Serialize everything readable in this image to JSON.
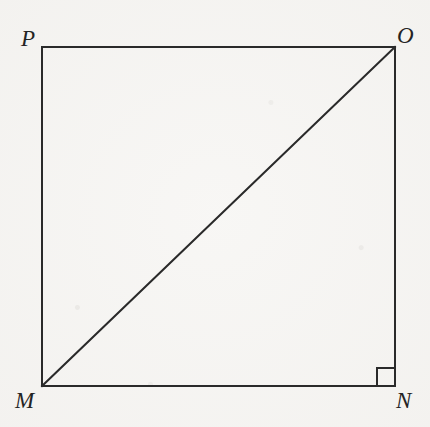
{
  "figure": {
    "name": "square-with-diagonal",
    "background_color": "#f5f4f2",
    "stroke_color": "#2a2a2a",
    "stroke_width": 2,
    "canvas": {
      "width": 430,
      "height": 427
    },
    "square": {
      "left": 42,
      "top": 47,
      "right": 395,
      "bottom": 386
    },
    "vertices": [
      {
        "id": "P",
        "label": "P",
        "x": 42,
        "y": 47,
        "position": "top-left"
      },
      {
        "id": "O",
        "label": "O",
        "x": 395,
        "y": 47,
        "position": "top-right"
      },
      {
        "id": "N",
        "label": "N",
        "x": 395,
        "y": 386,
        "position": "bottom-right"
      },
      {
        "id": "M",
        "label": "M",
        "x": 42,
        "y": 386,
        "position": "bottom-left"
      }
    ],
    "sides": [
      {
        "id": "PO",
        "from": "P",
        "to": "O"
      },
      {
        "id": "ON",
        "from": "O",
        "to": "N"
      },
      {
        "id": "NM",
        "from": "N",
        "to": "M"
      },
      {
        "id": "MP",
        "from": "M",
        "to": "P"
      }
    ],
    "diagonal": {
      "id": "MO",
      "from": "M",
      "to": "O",
      "x1": 42,
      "y1": 386,
      "x2": 395,
      "y2": 47
    },
    "right_angle_marker": {
      "at_vertex": "N",
      "size": 18,
      "x": 377,
      "y": 368
    }
  }
}
